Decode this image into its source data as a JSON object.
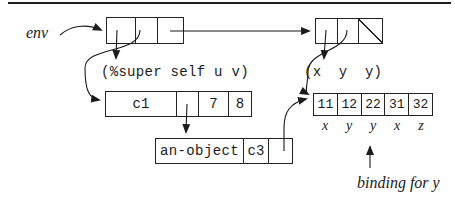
{
  "colors": {
    "ink": "#1b1b1b"
  },
  "env_label": "env",
  "left_formals": "(%super self u v)",
  "right_formals": "(x  y  y)",
  "class_frame": {
    "name": "c1",
    "values": [
      "7",
      "8"
    ]
  },
  "object_frame": {
    "name": "an-object",
    "class_ref": "c3"
  },
  "value_rib": [
    "11",
    "12",
    "22",
    "31",
    "32"
  ],
  "var_labels": [
    "x",
    "y",
    "y",
    "x",
    "z"
  ],
  "binding_label": "binding for y"
}
